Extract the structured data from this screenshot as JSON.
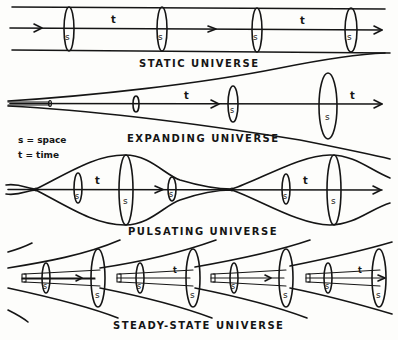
{
  "diagram": {
    "panels": [
      {
        "id": "static",
        "title": "STATIC UNIVERSE"
      },
      {
        "id": "expanding",
        "title": "EXPANDING UNIVERSE"
      },
      {
        "id": "pulsating",
        "title": "PULSATING UNIVERSE"
      },
      {
        "id": "steady-state",
        "title": "STEADY-STATE UNIVERSE"
      }
    ],
    "legend": {
      "space": "s = space",
      "time": "t = time"
    },
    "symbols": {
      "space": "s",
      "time": "t"
    }
  }
}
